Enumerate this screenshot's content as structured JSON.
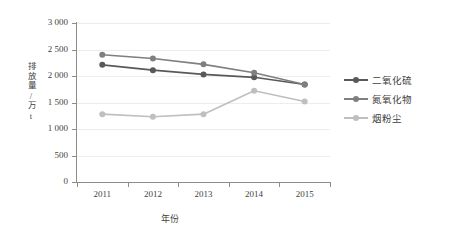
{
  "chart_data": {
    "type": "line",
    "title": "",
    "xlabel": "年份",
    "ylabel": "排放量/万t",
    "categories": [
      "2011",
      "2012",
      "2013",
      "2014",
      "2015"
    ],
    "ylim": [
      0,
      3000
    ],
    "ytick_labels": [
      "3 000",
      "2 500",
      "2 000",
      "1 500",
      "1 000",
      "500",
      "0"
    ],
    "ytick_values": [
      3000,
      2500,
      2000,
      1500,
      1000,
      500,
      0
    ],
    "grid": true,
    "legend_position": "right",
    "series": [
      {
        "name": "二氧化硫",
        "color": "#595959",
        "values": [
          2210,
          2110,
          2030,
          1975,
          1840
        ]
      },
      {
        "name": "氮氧化物",
        "color": "#7f7f7f",
        "values": [
          2400,
          2330,
          2220,
          2060,
          1840
        ]
      },
      {
        "name": "烟粉尘",
        "color": "#bfbfbf",
        "values": [
          1280,
          1230,
          1280,
          1720,
          1520
        ]
      }
    ]
  },
  "colors": {
    "axis": "#8c8c8c",
    "grid": "#ededed",
    "text": "#3f3f3f",
    "background": "#ffffff"
  }
}
